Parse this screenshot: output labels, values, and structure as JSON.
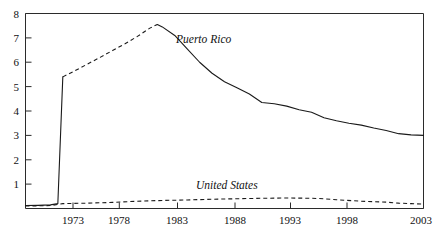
{
  "chart_data": {
    "type": "line",
    "title": "",
    "subtitle": "",
    "xlabel": "",
    "ylabel": "",
    "xlim": [
      1971,
      2003
    ],
    "ylim": [
      0,
      8
    ],
    "grid": false,
    "legend_position": "inline-annotation",
    "y_ticks": [
      "8",
      "7",
      "6",
      "5",
      "4",
      "3",
      "2",
      "1"
    ],
    "y_tick_values": [
      8,
      7,
      6,
      5,
      4,
      3,
      2,
      1
    ],
    "x_ticks": [
      "1973",
      "1978",
      "1983",
      "1988",
      "1993",
      "1998",
      "2003"
    ],
    "x_tick_values": [
      1973,
      1978,
      1983,
      1988,
      1993,
      1998,
      2003
    ],
    "annotations": [
      {
        "text": "Puerto Rico",
        "x": 1985,
        "y": 6.95,
        "style": "italic"
      },
      {
        "text": "United States",
        "x": 1989,
        "y": 0.95,
        "style": "italic"
      }
    ],
    "series": [
      {
        "name": "Puerto Rico",
        "style": "mixed-solid-dashed",
        "x": [
          1971,
          1972,
          1973,
          1973.6,
          1974,
          1975,
          1976,
          1977,
          1978,
          1979,
          1980,
          1981,
          1981.6,
          1982,
          1983,
          1984,
          1985,
          1986,
          1987,
          1988,
          1989,
          1990,
          1991,
          1992,
          1993,
          1994,
          1995,
          1996,
          1997,
          1998,
          1999,
          2000,
          2001,
          2002,
          2003
        ],
        "values": [
          0.12,
          0.13,
          0.15,
          0.2,
          5.4,
          5.66,
          5.93,
          6.2,
          6.48,
          6.76,
          7.06,
          7.4,
          7.55,
          7.45,
          7.1,
          6.55,
          6.0,
          5.55,
          5.2,
          4.95,
          4.7,
          4.35,
          4.3,
          4.2,
          4.05,
          3.95,
          3.72,
          3.6,
          3.5,
          3.42,
          3.3,
          3.2,
          3.07,
          3.02,
          3.0
        ],
        "dashed_segment_x": [
          1974,
          1981.6
        ],
        "solid_segment_x": [
          1981.6,
          2003
        ],
        "spike_year": 1974,
        "peak_value": 7.55,
        "peak_year": 1981,
        "end_value": 3.0
      },
      {
        "name": "United States",
        "style": "dashed",
        "x": [
          1971,
          1973,
          1974,
          1976,
          1978,
          1980,
          1982,
          1984,
          1986,
          1988,
          1990,
          1992,
          1994,
          1995,
          1996,
          1998,
          2000,
          2001,
          2002,
          2003
        ],
        "values": [
          0.1,
          0.12,
          0.2,
          0.22,
          0.25,
          0.3,
          0.33,
          0.35,
          0.38,
          0.4,
          0.42,
          0.43,
          0.42,
          0.4,
          0.36,
          0.3,
          0.26,
          0.22,
          0.2,
          0.18
        ]
      }
    ]
  },
  "colors": {
    "axis": "#2b2b2b",
    "series_line": "#1a1a1a",
    "background": "#ffffff",
    "text": "#111111"
  }
}
